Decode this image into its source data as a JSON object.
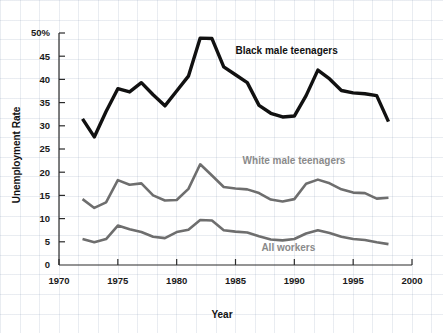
{
  "chart_data": {
    "type": "line",
    "title": "",
    "xlabel": "Year",
    "ylabel": "Unemployment Rate",
    "xlim": [
      1970,
      2000
    ],
    "ylim": [
      0,
      50
    ],
    "grid": true,
    "legend_position": "inline-annotations",
    "x_ticks": [
      "1970",
      "1975",
      "1980",
      "1985",
      "1990",
      "1995",
      "2000"
    ],
    "y_ticks": [
      "0",
      "5",
      "10",
      "15",
      "20",
      "25",
      "30",
      "35",
      "40",
      "45",
      "50%"
    ],
    "x": [
      1972,
      1973,
      1974,
      1975,
      1976,
      1977,
      1978,
      1979,
      1980,
      1981,
      1982,
      1983,
      1984,
      1985,
      1986,
      1987,
      1988,
      1989,
      1990,
      1991,
      1992,
      1993,
      1994,
      1995,
      1996,
      1997,
      1998
    ],
    "series": [
      {
        "name": "Black male teenagers",
        "color": "#111111",
        "label_x": 1985.0,
        "label_y": 45.4,
        "values": [
          31.5,
          27.6,
          33.1,
          38.0,
          37.3,
          39.3,
          36.7,
          34.3,
          37.5,
          40.7,
          48.9,
          48.8,
          42.7,
          41.0,
          39.3,
          34.4,
          32.7,
          31.9,
          32.1,
          36.5,
          42.0,
          40.1,
          37.6,
          37.1,
          36.9,
          36.5,
          30.9
        ]
      },
      {
        "name": "White male teenagers",
        "color": "#6e6e6e",
        "label_x": 1985.6,
        "label_y": 21.8,
        "values": [
          14.2,
          12.3,
          13.5,
          18.3,
          17.3,
          17.6,
          15.0,
          13.9,
          14.0,
          16.4,
          21.7,
          19.3,
          16.8,
          16.5,
          16.3,
          15.5,
          14.1,
          13.7,
          14.2,
          17.5,
          18.4,
          17.6,
          16.3,
          15.6,
          15.5,
          14.3,
          14.5
        ]
      },
      {
        "name": "All workers",
        "color": "#6e6e6e",
        "label_x": 1987.2,
        "label_y": 3.0,
        "values": [
          5.6,
          4.9,
          5.6,
          8.5,
          7.7,
          7.1,
          6.1,
          5.8,
          7.1,
          7.6,
          9.7,
          9.6,
          7.5,
          7.2,
          7.0,
          6.2,
          5.5,
          5.3,
          5.6,
          6.8,
          7.5,
          6.9,
          6.1,
          5.6,
          5.4,
          4.9,
          4.5
        ]
      }
    ]
  },
  "axes": {
    "y_axis_title": "Unemployment Rate",
    "x_axis_title": "Year",
    "y_tick_labels": [
      "50%",
      "45",
      "40",
      "35",
      "30",
      "25",
      "20",
      "15",
      "10",
      "5",
      "0"
    ],
    "x_tick_labels": [
      "1970",
      "1975",
      "1980",
      "1985",
      "1990",
      "1995",
      "2000"
    ]
  },
  "annotations": {
    "black_series_label": "Black male teenagers",
    "white_series_label": "White male teenagers",
    "all_workers_label": "All workers"
  }
}
